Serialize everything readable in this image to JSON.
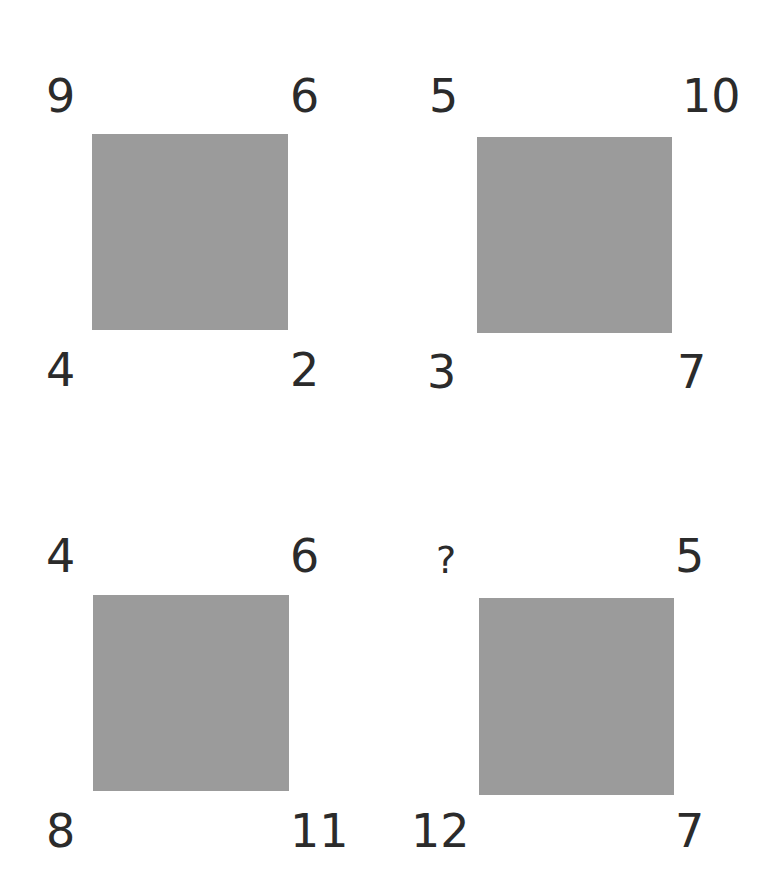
{
  "puzzle": {
    "fill_color": "#9b9b9b",
    "text_color": "#2b2b2b",
    "squares": [
      {
        "top_left": "9",
        "top_right": "6",
        "bottom_left": "4",
        "bottom_right": "2"
      },
      {
        "top_left": "5",
        "top_right": "10",
        "bottom_left": "3",
        "bottom_right": "7"
      },
      {
        "top_left": "4",
        "top_right": "6",
        "bottom_left": "8",
        "bottom_right": "11"
      },
      {
        "top_left": "?",
        "top_right": "5",
        "bottom_left": "12",
        "bottom_right": "7"
      }
    ]
  }
}
